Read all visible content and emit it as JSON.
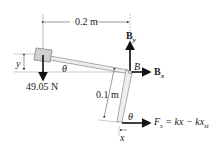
{
  "diagram": {
    "dim_horizontal": "0.2 m",
    "dim_arm": "0.1 m",
    "dim_y": "y",
    "dim_x": "x",
    "angle_theta_top": "θ",
    "angle_theta_bottom": "θ",
    "weight_label": "49.05 N",
    "pin_label": "B",
    "by_label": "B",
    "by_sub": "y",
    "bx_label": "B",
    "bx_sub": "x",
    "force_label_main": "F",
    "force_label_sub": "s",
    "force_eq": " = kx − kx",
    "force_eq_sub": "st"
  }
}
